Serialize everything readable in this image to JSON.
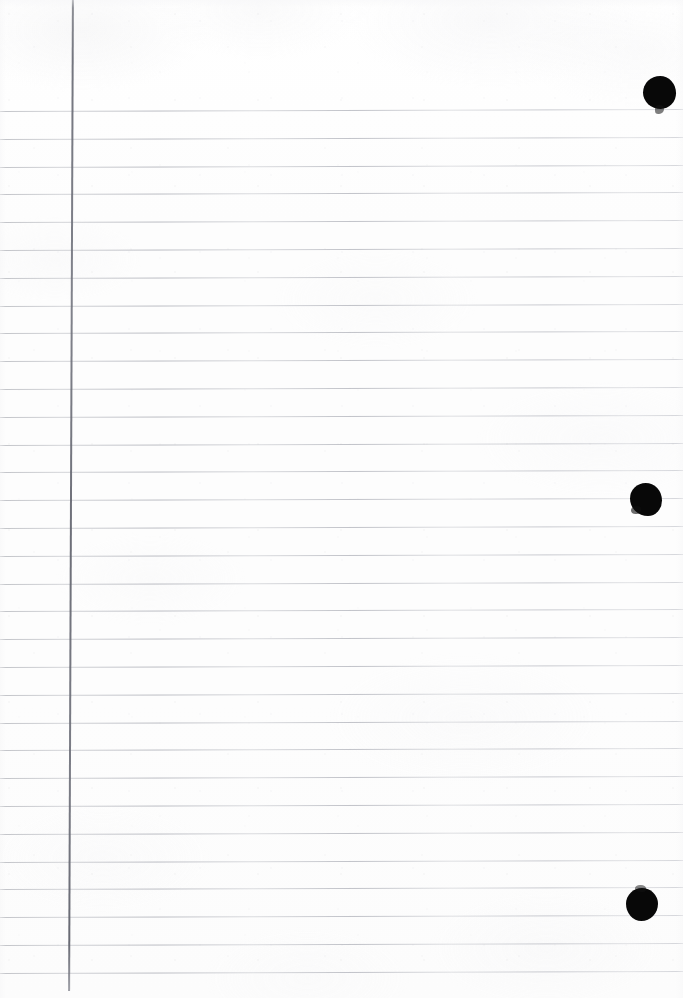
{
  "document": {
    "kind": "scanned-lined-notebook-page",
    "title": "Lined Notebook Paper Scan",
    "width": 683,
    "height": 998,
    "text_content": "",
    "has_handwriting": "no",
    "paper_color": "#fdfdfd",
    "rule_color": "#b2b4ba",
    "margin_rule_color": "#6a6c76",
    "ink_color": "#080808"
  },
  "ruling": {
    "label": "horizontal-ruled-lines",
    "first_line_y": 110,
    "spacing": 27.8,
    "count": 33,
    "left_x": 0,
    "right_x": 683,
    "thickness": 1
  },
  "margin_rule": {
    "label": "vertical-margin-line",
    "x": 70,
    "top_y": 0,
    "bottom_y": 991,
    "thickness": 2
  },
  "ink_marks": [
    {
      "name": "ink-blob-top",
      "x": 643,
      "y": 76,
      "width": 33,
      "height": 33
    },
    {
      "name": "ink-blob-middle",
      "x": 630,
      "y": 483,
      "width": 32,
      "height": 33
    },
    {
      "name": "ink-blob-bottom",
      "x": 626,
      "y": 888,
      "width": 32,
      "height": 33
    }
  ]
}
